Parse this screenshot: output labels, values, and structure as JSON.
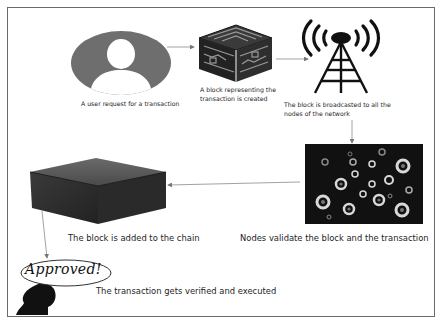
{
  "diagram": {
    "steps": [
      {
        "id": "user-request",
        "icon": "user-avatar-icon",
        "label": "A user request for a transaction"
      },
      {
        "id": "block-created",
        "icon": "block-cube-icon",
        "label": "A block representing the transaction is created"
      },
      {
        "id": "broadcast",
        "icon": "broadcast-tower-icon",
        "label": "The block is broadcasted to all the nodes of the network"
      },
      {
        "id": "validate",
        "icon": "network-nodes-icon",
        "label": "Nodes validate the block and the transaction"
      },
      {
        "id": "added-to-chain",
        "icon": "chain-block-icon",
        "label": "The block is added to the chain"
      },
      {
        "id": "verified",
        "icon": "approved-head-icon",
        "label": "The transaction gets verified and executed",
        "badge": "Approved!"
      }
    ],
    "flow": [
      "user-request",
      "block-created",
      "broadcast",
      "validate",
      "added-to-chain",
      "verified"
    ],
    "colors": {
      "border": "#6a6a6a",
      "avatar_gray": "#6e6e6e",
      "dark_block": "#2b2b2b",
      "arrow": "#8a8a8a"
    }
  }
}
